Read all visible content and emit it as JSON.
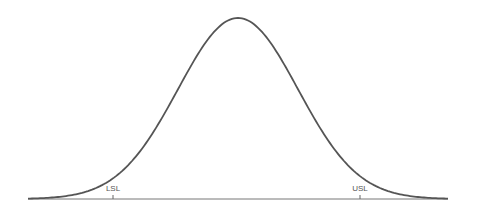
{
  "chart_data": {
    "type": "line",
    "title": "",
    "xlabel": "",
    "ylabel": "",
    "series": [
      {
        "name": "normal-distribution",
        "mean": 0,
        "sd": 1
      }
    ],
    "annotations": [
      {
        "label": "LSL",
        "x_sigma": -2.06
      },
      {
        "label": "USL",
        "x_sigma": 2.0
      }
    ],
    "x_range_sigma": [
      -3.5,
      3.5
    ],
    "grid": false,
    "legend": "none"
  },
  "labels": {
    "lsl": "LSL",
    "usl": "USL"
  },
  "colors": {
    "curve": "#555555",
    "axis": "#666666"
  }
}
